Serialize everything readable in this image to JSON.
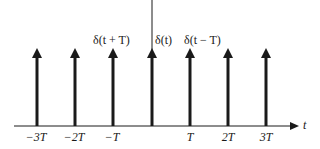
{
  "diagram": {
    "axis": {
      "label": "t"
    },
    "impulses": [
      {
        "position": "-3T",
        "x": 37
      },
      {
        "position": "-2T",
        "x": 75
      },
      {
        "position": "-T",
        "x": 113
      },
      {
        "position": "0",
        "x": 152
      },
      {
        "position": "T",
        "x": 190
      },
      {
        "position": "2T",
        "x": 228
      },
      {
        "position": "3T",
        "x": 266
      }
    ],
    "tick_labels": [
      "−3T",
      "−2T",
      "−T",
      "T",
      "2T",
      "3T"
    ],
    "impulse_labels": {
      "minus_T": "δ(t + T)",
      "zero": "δ(t)",
      "plus_T": "δ(t − T)"
    },
    "colors": {
      "line": "#1a1a1a",
      "background": "#ffffff"
    }
  }
}
